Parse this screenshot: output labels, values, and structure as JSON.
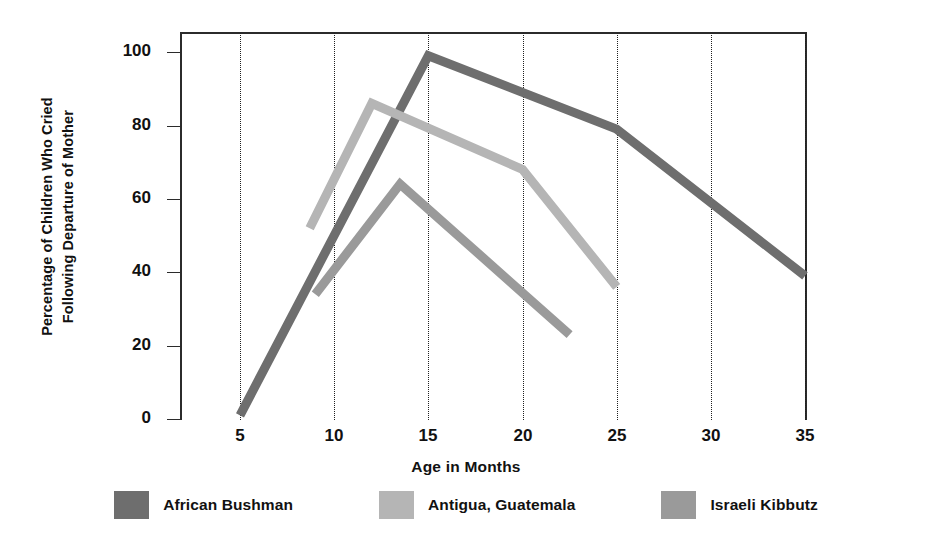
{
  "chart_data": {
    "type": "line",
    "title": "",
    "xlabel": "Age in Months",
    "ylabel": "Percentage of Children Who Cried Following Departure of Mother",
    "ylabel_line1": "Percentage of Children Who Cried",
    "ylabel_line2": "Following Departure of Mother",
    "xlim": [
      2.5,
      38
    ],
    "ylim": [
      0,
      108
    ],
    "xticks": [
      5,
      10,
      15,
      20,
      25,
      30,
      35
    ],
    "xtick_labels": [
      "5",
      "10",
      "15",
      "20",
      "25",
      "30",
      "35"
    ],
    "yticks": [
      0,
      20,
      40,
      60,
      80,
      100
    ],
    "ytick_labels": [
      "0",
      "20",
      "40",
      "60",
      "80",
      "100"
    ],
    "grid": "vertical dotted gridlines at each x tick",
    "legend_position": "below plot, horizontal",
    "series": [
      {
        "name": "African Bushman",
        "color": "#6e6e6e",
        "x": [
          5,
          15,
          25,
          35
        ],
        "y": [
          1,
          99,
          79,
          39
        ]
      },
      {
        "name": "Antigua, Guatemala",
        "color": "#b5b5b5",
        "x": [
          8.7,
          12,
          20,
          25
        ],
        "y": [
          52,
          86,
          68,
          36
        ]
      },
      {
        "name": "Israeli Kibbutz",
        "color": "#9a9a9a",
        "x": [
          9,
          13.5,
          22.5
        ],
        "y": [
          34,
          64,
          23
        ]
      }
    ]
  },
  "axis": {
    "x_title": "Age in Months",
    "y_title_line1": "Percentage of Children Who Cried",
    "y_title_line2": "Following Departure of Mother",
    "x_tick_labels": [
      "5",
      "10",
      "15",
      "20",
      "25",
      "30",
      "35"
    ],
    "y_tick_labels": [
      "100",
      "80",
      "60",
      "40",
      "20",
      "0"
    ]
  },
  "legend": {
    "items": [
      {
        "label": "African Bushman",
        "color": "#6e6e6e"
      },
      {
        "label": "Antigua, Guatemala",
        "color": "#b5b5b5"
      },
      {
        "label": "Israeli Kibbutz",
        "color": "#9a9a9a"
      }
    ]
  }
}
